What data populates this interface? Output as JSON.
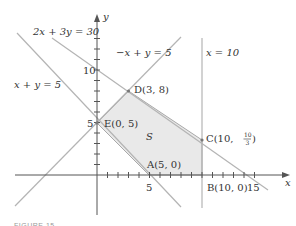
{
  "figure": {
    "caption": "FIGURE 15",
    "colors": {
      "axis": "#555555",
      "line": "#b4b4b4",
      "region_fill": "#e9e9e9",
      "region_stroke": "#a8a8a8",
      "text": "#333333"
    },
    "axes": {
      "x_label": "x",
      "y_label": "y",
      "x_ticks_labeled": [
        "5",
        "10",
        "15"
      ],
      "y_ticks_labeled": [
        "5",
        "10"
      ]
    },
    "lines": [
      {
        "id": "line-2x3y30",
        "label": "2x + 3y = 30"
      },
      {
        "id": "line-neg-x-y5",
        "label": "−x + y = 5"
      },
      {
        "id": "line-x10",
        "label": "x = 10"
      },
      {
        "id": "line-xy5",
        "label": "x + y = 5"
      }
    ],
    "region": {
      "label": "S"
    },
    "points": [
      {
        "id": "A",
        "label": "A(5, 0)",
        "x": 5,
        "y": 0
      },
      {
        "id": "B",
        "label": "B(10, 0)",
        "x": 10,
        "y": 0
      },
      {
        "id": "C",
        "label_prefix": "C",
        "label_x": "10",
        "label_num": "10",
        "label_den": "3",
        "x": 10,
        "y": 3.333
      },
      {
        "id": "D",
        "label": "D(3, 8)",
        "x": 3,
        "y": 8
      },
      {
        "id": "E",
        "label": "E(0, 5)",
        "x": 0,
        "y": 5
      }
    ]
  }
}
